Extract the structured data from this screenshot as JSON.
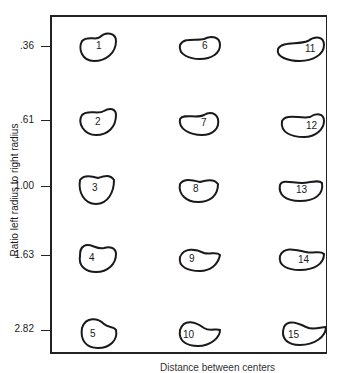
{
  "figure": {
    "ylabel": "Ratio left radius to right radius",
    "xlabel": "Distance between centers",
    "y_ticks": [
      ".36",
      ".61",
      "1.00",
      "1.63",
      "2.82"
    ],
    "shapes": [
      {
        "id": "1",
        "row": 0,
        "col": 0
      },
      {
        "id": "2",
        "row": 1,
        "col": 0
      },
      {
        "id": "3",
        "row": 2,
        "col": 0
      },
      {
        "id": "4",
        "row": 3,
        "col": 0
      },
      {
        "id": "5",
        "row": 4,
        "col": 0
      },
      {
        "id": "6",
        "row": 0,
        "col": 1
      },
      {
        "id": "7",
        "row": 1,
        "col": 1
      },
      {
        "id": "8",
        "row": 2,
        "col": 1
      },
      {
        "id": "9",
        "row": 3,
        "col": 1
      },
      {
        "id": "10",
        "row": 4,
        "col": 1
      },
      {
        "id": "11",
        "row": 0,
        "col": 2
      },
      {
        "id": "12",
        "row": 1,
        "col": 2
      },
      {
        "id": "13",
        "row": 2,
        "col": 2
      },
      {
        "id": "14",
        "row": 3,
        "col": 2
      },
      {
        "id": "15",
        "row": 4,
        "col": 2
      }
    ],
    "colors": {
      "ink": "#1a1a1a",
      "background": "#ffffff"
    }
  }
}
